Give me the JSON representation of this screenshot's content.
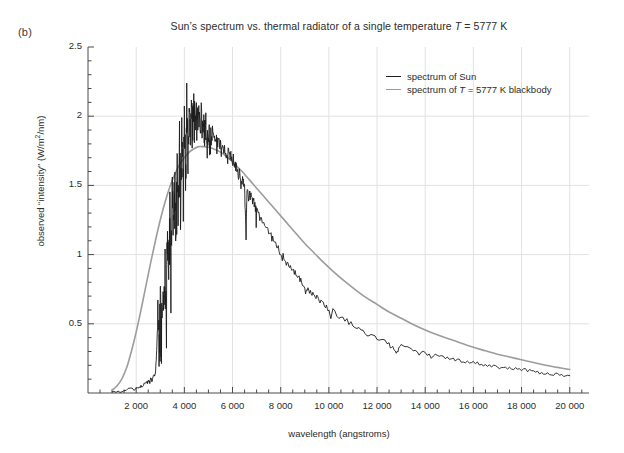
{
  "panel": {
    "label": "(b)"
  },
  "chart_data": {
    "type": "line",
    "title": "Sun’s spectrum vs. thermal radiator of a single temperature T = 5777 K",
    "title_parts": {
      "before_italic": "Sun’s spectrum vs. thermal radiator of a single temperature ",
      "italic": "T",
      "after_italic": " = 5777 K"
    },
    "xlabel": "wavelength (angstroms)",
    "ylabel": "observed “intensity” (W/m²/nm)",
    "ylabel_parts": {
      "prefix": "observed “intensity” (W/m",
      "sup": "2",
      "suffix": "/nm)"
    },
    "xlim": [
      0,
      20800
    ],
    "ylim": [
      0,
      2.5
    ],
    "grid": true,
    "legend_position": "top-right",
    "xticks": [
      2000,
      4000,
      6000,
      8000,
      10000,
      12000,
      14000,
      16000,
      18000,
      20000
    ],
    "xtick_labels": [
      "2 000",
      "4 000",
      "6 000",
      "8 000",
      "10 000",
      "12 000",
      "14 000",
      "16 000",
      "18 000",
      "20 000"
    ],
    "xtick_minor_step": 500,
    "yticks": [
      0.5,
      1,
      1.5,
      2,
      2.5
    ],
    "ytick_labels": [
      "0.5",
      "1",
      "1.5",
      "2",
      "2.5"
    ],
    "ytick_minor_step": 0.1,
    "series": [
      {
        "name": "spectrum of Sun",
        "label_parts": {
          "before_italic": "spectrum of Sun",
          "italic": "",
          "after_italic": ""
        },
        "color": "#1c1c1c",
        "width": 0.9,
        "x": [
          1000,
          1500,
          2000,
          2200,
          2400,
          2500,
          2600,
          2700,
          2800,
          2850,
          2900,
          2950,
          3000,
          3050,
          3100,
          3150,
          3200,
          3250,
          3300,
          3350,
          3400,
          3450,
          3500,
          3550,
          3600,
          3650,
          3700,
          3750,
          3800,
          3850,
          3900,
          3950,
          4000,
          4050,
          4100,
          4150,
          4200,
          4250,
          4300,
          4350,
          4400,
          4450,
          4500,
          4550,
          4600,
          4650,
          4700,
          4750,
          4800,
          4850,
          4900,
          4950,
          5000,
          5100,
          5200,
          5300,
          5400,
          5500,
          5600,
          5700,
          5800,
          5900,
          6000,
          6100,
          6200,
          6300,
          6400,
          6500,
          6560,
          6600,
          6700,
          6800,
          6900,
          7000,
          7200,
          7400,
          7600,
          7800,
          8000,
          8200,
          8400,
          8600,
          8800,
          9000,
          9200,
          9400,
          9600,
          9800,
          10000,
          10500,
          11000,
          11500,
          12000,
          12500,
          12800,
          13000,
          13500,
          14000,
          14500,
          15000,
          15500,
          16000,
          16500,
          17000,
          17500,
          18000,
          18500,
          19000,
          19500,
          20000
        ],
        "y": [
          0.01,
          0.02,
          0.03,
          0.05,
          0.07,
          0.08,
          0.1,
          0.12,
          0.14,
          0.3,
          0.55,
          0.35,
          0.72,
          0.5,
          0.78,
          0.58,
          0.95,
          0.62,
          1.18,
          0.82,
          1.32,
          1.0,
          1.45,
          1.15,
          1.62,
          1.2,
          1.73,
          1.3,
          1.85,
          1.42,
          1.95,
          1.5,
          2.05,
          1.62,
          2.1,
          1.75,
          2.12,
          1.85,
          2.15,
          1.9,
          2.12,
          1.96,
          2.08,
          1.98,
          2.06,
          1.95,
          2.02,
          1.9,
          1.98,
          1.85,
          1.96,
          1.8,
          1.92,
          1.88,
          1.86,
          1.84,
          1.82,
          1.8,
          1.78,
          1.76,
          1.74,
          1.72,
          1.7,
          1.66,
          1.62,
          1.58,
          1.55,
          1.5,
          1.12,
          1.48,
          1.44,
          1.4,
          1.36,
          1.33,
          1.26,
          1.2,
          1.14,
          1.08,
          1.02,
          0.97,
          0.92,
          0.87,
          0.82,
          0.78,
          0.74,
          0.71,
          0.67,
          0.64,
          0.61,
          0.55,
          0.49,
          0.44,
          0.4,
          0.36,
          0.3,
          0.34,
          0.31,
          0.29,
          0.27,
          0.25,
          0.235,
          0.22,
          0.205,
          0.19,
          0.18,
          0.17,
          0.155,
          0.145,
          0.135,
          0.125
        ]
      },
      {
        "name": "spectrum of T = 5777 K blackbody",
        "label_parts": {
          "before_italic": "spectrum of ",
          "italic": "T",
          "after_italic": " = 5777 K blackbody"
        },
        "color": "#9c9c9c",
        "width": 1.6,
        "x": [
          1000,
          1200,
          1400,
          1600,
          1800,
          2000,
          2200,
          2400,
          2600,
          2800,
          3000,
          3200,
          3400,
          3600,
          3800,
          4000,
          4200,
          4400,
          4600,
          4800,
          5000,
          5200,
          5400,
          5600,
          5800,
          6000,
          6200,
          6400,
          6600,
          6800,
          7000,
          7400,
          7800,
          8200,
          8600,
          9000,
          9400,
          9800,
          10200,
          10600,
          11000,
          11500,
          12000,
          12500,
          13000,
          13500,
          14000,
          14500,
          15000,
          15500,
          16000,
          16500,
          17000,
          17500,
          18000,
          18500,
          19000,
          19500,
          20000
        ],
        "y": [
          0.02,
          0.05,
          0.1,
          0.18,
          0.3,
          0.44,
          0.6,
          0.77,
          0.94,
          1.1,
          1.25,
          1.38,
          1.49,
          1.58,
          1.65,
          1.7,
          1.74,
          1.765,
          1.78,
          1.78,
          1.775,
          1.765,
          1.75,
          1.73,
          1.7,
          1.67,
          1.635,
          1.6,
          1.56,
          1.52,
          1.48,
          1.4,
          1.32,
          1.24,
          1.16,
          1.08,
          1.01,
          0.94,
          0.875,
          0.815,
          0.76,
          0.695,
          0.64,
          0.585,
          0.54,
          0.495,
          0.455,
          0.42,
          0.39,
          0.36,
          0.33,
          0.305,
          0.28,
          0.26,
          0.24,
          0.22,
          0.2,
          0.185,
          0.17
        ]
      }
    ]
  }
}
